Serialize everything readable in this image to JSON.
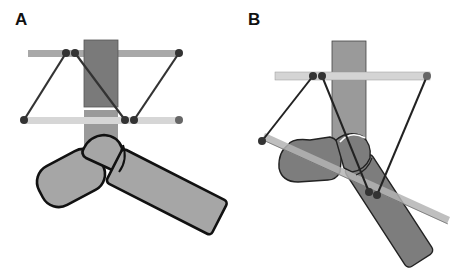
{
  "panels": [
    {
      "label": "A"
    },
    {
      "label": "B"
    }
  ],
  "colors": {
    "stroke": "#111111",
    "dot": "#333333",
    "dot_gray": "#5a5a5a",
    "rect_dark": "#7a7a7a",
    "rect_mid": "#9a9a9a",
    "bar_top_a": "#a8a8a8",
    "bar_bottom_a": "#d6d6d6",
    "bar_b": "#d4d4d4",
    "bone_a": "#a6a6a6",
    "bone_b": "#7d7d7d",
    "bar_diag_b": "#b4b4b4"
  }
}
